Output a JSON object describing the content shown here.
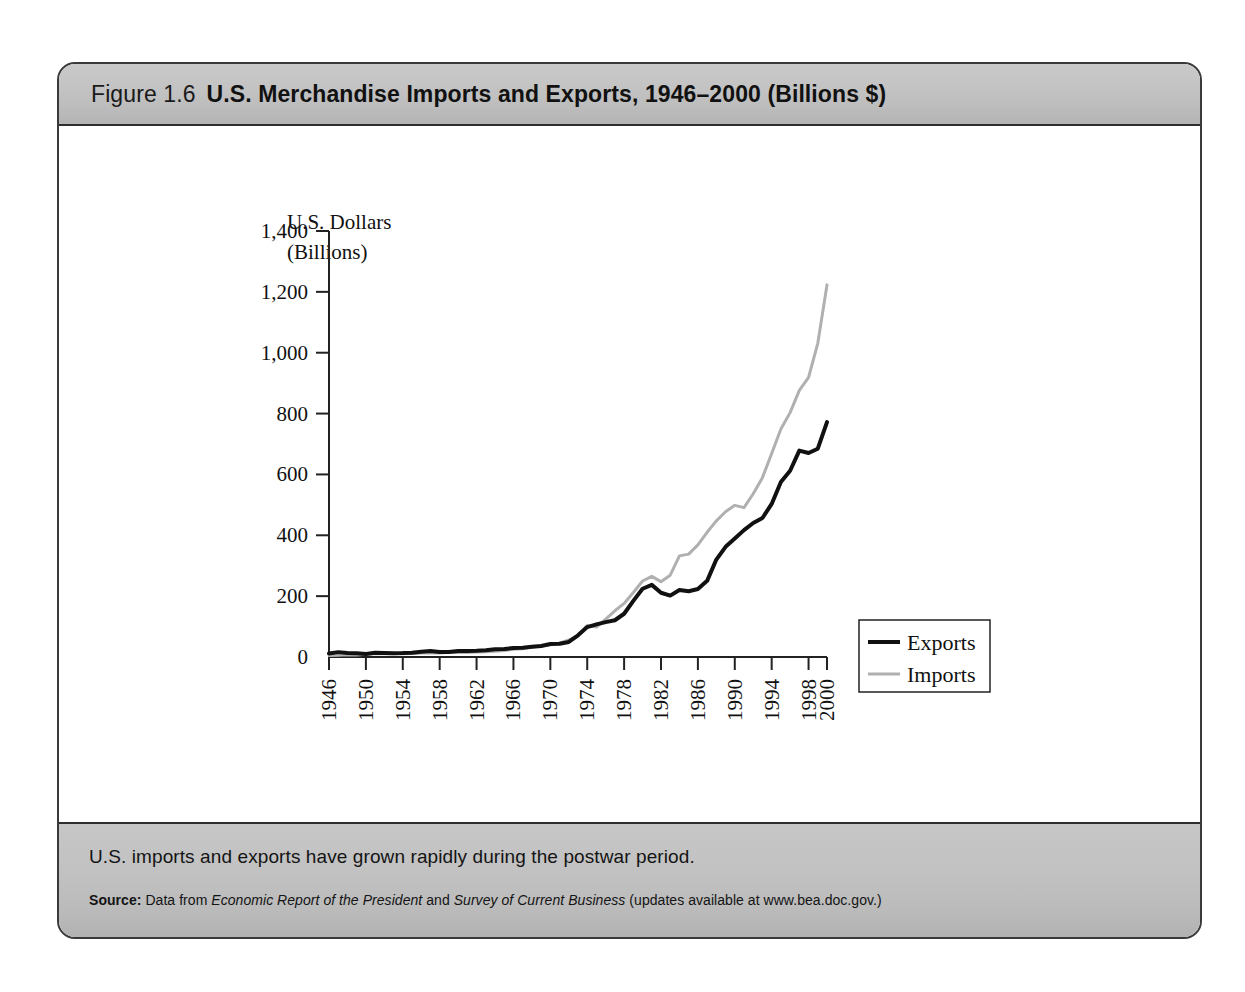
{
  "figure": {
    "number_label": "Figure 1.6",
    "title": "U.S. Merchandise Imports and Exports, 1946–2000 (Billions $)",
    "caption": "U.S. imports and exports have grown rapidly during the postwar period.",
    "source": {
      "label": "Source:",
      "prefix": "Data from",
      "work1": "Economic Report of the President",
      "conjunction": "and",
      "work2": "Survey of Current Business",
      "suffix": "(updates available at www.bea.doc.gov.)"
    }
  },
  "colors": {
    "exports_line": "#111111",
    "imports_line": "#b0b0b0",
    "axis": "#222222",
    "header_gray": "#c2c2c2",
    "frame_border": "#3a3a3a",
    "plot_background": "#ffffff"
  },
  "chart_data": {
    "type": "line",
    "title": "U.S. Merchandise Imports and Exports, 1946–2000 (Billions $)",
    "xlabel": "Year",
    "ylabel": "U.S. Dollars (Billions)",
    "ylabel_line1": "U.S. Dollars",
    "ylabel_line2": "(Billions)",
    "xlim": [
      1946,
      2000
    ],
    "ylim": [
      0,
      1400
    ],
    "ytick_values": [
      0,
      200,
      400,
      600,
      800,
      1000,
      1200,
      1400
    ],
    "ytick_labels": [
      "0",
      "200",
      "400",
      "600",
      "800",
      "1,000",
      "1,200",
      "1,400"
    ],
    "xtick_values": [
      1946,
      1950,
      1954,
      1958,
      1962,
      1966,
      1970,
      1974,
      1978,
      1982,
      1986,
      1990,
      1994,
      1998,
      2000
    ],
    "xtick_labels": [
      "1946",
      "1950",
      "1954",
      "1958",
      "1962",
      "1966",
      "1970",
      "1974",
      "1978",
      "1982",
      "1986",
      "1990",
      "1994",
      "1998",
      "2000"
    ],
    "grid": false,
    "legend_position": "center-right",
    "x": [
      1946,
      1947,
      1948,
      1949,
      1950,
      1951,
      1952,
      1953,
      1954,
      1955,
      1956,
      1957,
      1958,
      1959,
      1960,
      1961,
      1962,
      1963,
      1964,
      1965,
      1966,
      1967,
      1968,
      1969,
      1970,
      1971,
      1972,
      1973,
      1974,
      1975,
      1976,
      1977,
      1978,
      1979,
      1980,
      1981,
      1982,
      1983,
      1984,
      1985,
      1986,
      1987,
      1988,
      1989,
      1990,
      1991,
      1992,
      1993,
      1994,
      1995,
      1996,
      1997,
      1998,
      1999,
      2000
    ],
    "series": [
      {
        "name": "Exports",
        "color": "#111111",
        "values": [
          11.8,
          16.0,
          13.2,
          12.1,
          10.2,
          14.2,
          13.3,
          12.3,
          12.8,
          14.3,
          17.3,
          19.5,
          16.3,
          16.3,
          19.6,
          20.1,
          20.8,
          22.3,
          25.5,
          26.5,
          29.3,
          30.7,
          33.6,
          36.4,
          42.5,
          43.3,
          49.4,
          71.4,
          98.3,
          107.1,
          114.7,
          120.8,
          142.1,
          184.4,
          224.3,
          237.0,
          211.2,
          201.8,
          219.9,
          215.9,
          223.3,
          250.2,
          320.2,
          362.1,
          389.3,
          416.9,
          440.4,
          456.8,
          502.9,
          575.2,
          612.1,
          678.4,
          670.4,
          684.6,
          772.0
        ]
      },
      {
        "name": "Imports",
        "color": "#b0b0b0",
        "values": [
          5.1,
          6.0,
          7.1,
          6.6,
          9.1,
          11.2,
          10.8,
          11.0,
          10.4,
          11.5,
          12.8,
          13.3,
          13.0,
          15.3,
          14.8,
          14.5,
          16.3,
          17.0,
          18.7,
          21.5,
          25.5,
          26.9,
          33.0,
          35.8,
          39.9,
          45.6,
          55.8,
          70.5,
          103.8,
          98.2,
          124.2,
          151.9,
          176.0,
          212.0,
          249.8,
          265.1,
          247.6,
          268.9,
          332.4,
          338.1,
          368.4,
          409.8,
          447.2,
          477.4,
          498.4,
          491.0,
          536.5,
          589.4,
          668.7,
          749.4,
          803.1,
          876.4,
          918.6,
          1031.0,
          1223.0
        ]
      }
    ],
    "legend": [
      {
        "label": "Exports",
        "color": "#111111",
        "line_width": 4
      },
      {
        "label": "Imports",
        "color": "#b0b0b0",
        "line_width": 3
      }
    ]
  }
}
